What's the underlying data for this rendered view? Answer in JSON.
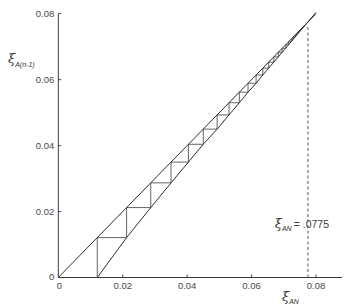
{
  "chart_data": {
    "type": "line",
    "title": "",
    "xlabel": {
      "symbol": "ξ",
      "subscript": "AN"
    },
    "ylabel": {
      "symbol": "ξ",
      "subscript": "A(n-1)"
    },
    "xlim": [
      0,
      0.08
    ],
    "ylim": [
      0,
      0.08
    ],
    "grid": false,
    "legend": null,
    "x_ticks": [
      0,
      0.02,
      0.04,
      0.06,
      0.08
    ],
    "x_tick_labels": [
      "0",
      "0.02",
      "0.04",
      "0.06",
      "0.08"
    ],
    "y_ticks": [
      0,
      0.02,
      0.04,
      0.06,
      0.08
    ],
    "y_tick_labels": [
      "0",
      "0.02",
      "0.04",
      "0.06",
      "0.08"
    ],
    "series": [
      {
        "name": "diagonal (y = x)",
        "style": "solid",
        "x": [
          0,
          0.08
        ],
        "y": [
          0,
          0.08
        ]
      },
      {
        "name": "operating curve",
        "style": "solid",
        "x": [
          0.0121,
          0.0212,
          0.0287,
          0.035,
          0.0404,
          0.045,
          0.0493,
          0.053,
          0.0562,
          0.0589,
          0.0614,
          0.0635,
          0.0653,
          0.0669,
          0.0683,
          0.0695,
          0.0706,
          0.0715,
          0.0723,
          0.073,
          0.0736,
          0.0741,
          0.0745,
          0.0749,
          0.0752,
          0.0755,
          0.0758,
          0.076,
          0.0762,
          0.0775,
          0.08
        ],
        "y": [
          0,
          0.0121,
          0.0212,
          0.0287,
          0.035,
          0.0404,
          0.045,
          0.0493,
          0.053,
          0.0562,
          0.0589,
          0.0614,
          0.0635,
          0.0653,
          0.0669,
          0.0683,
          0.0695,
          0.0706,
          0.0715,
          0.0723,
          0.073,
          0.0736,
          0.0741,
          0.0745,
          0.0749,
          0.0752,
          0.0755,
          0.0758,
          0.076,
          0.0775,
          0.0804
        ]
      },
      {
        "name": "stepwise construction",
        "style": "solid",
        "steps_x": [
          0.0121,
          0.0212,
          0.0287,
          0.035,
          0.0404,
          0.045,
          0.0493,
          0.053,
          0.0562,
          0.0589,
          0.0614,
          0.0635,
          0.0653,
          0.0669,
          0.0683,
          0.0695,
          0.0706,
          0.0715,
          0.0723,
          0.073,
          0.0736,
          0.0741,
          0.0745,
          0.0749,
          0.0752,
          0.0755,
          0.0758,
          0.076,
          0.0762
        ]
      }
    ],
    "annotations": [
      {
        "type": "vline",
        "style": "dashed",
        "x": 0.0775,
        "y_from": 0,
        "y_to": 0.0765
      },
      {
        "type": "label",
        "symbol": "ξ",
        "subscript": "AN",
        "text": "= .0775",
        "x": 0.0672,
        "y": 0.015
      }
    ]
  }
}
